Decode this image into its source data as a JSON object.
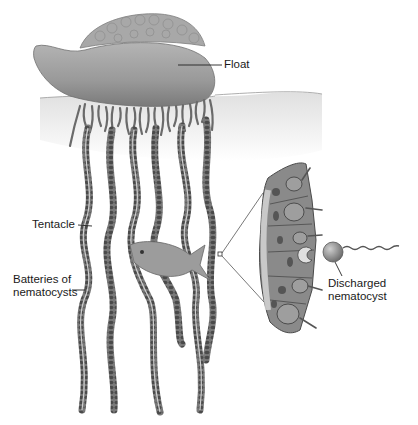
{
  "diagram": {
    "labels": {
      "float": "Float",
      "tentacle": "Tentacle",
      "batteries_line1": "Batteries of",
      "batteries_line2": "nematocysts",
      "discharged_line1": "Discharged",
      "discharged_line2": "nematocyst"
    },
    "colors": {
      "body": "#9a9a9a",
      "body_dark": "#6e6e6e",
      "tentacle": "#5a5a5a",
      "water": "#ececec",
      "line": "#333333",
      "background": "#ffffff"
    }
  }
}
